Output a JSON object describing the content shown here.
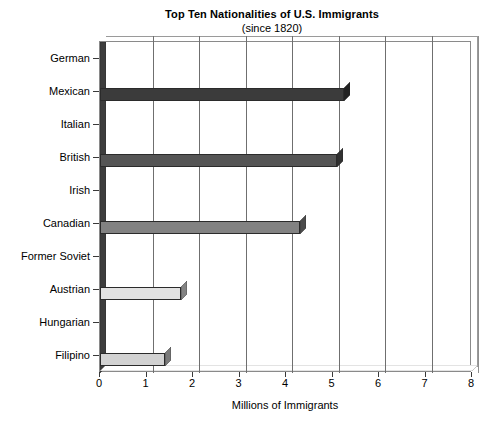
{
  "chart_data": {
    "type": "bar",
    "orientation": "horizontal",
    "title": "Top Ten Nationalities of U.S. Immigrants",
    "subtitle": "(since 1820)",
    "xlabel": "Millions of Immigrants",
    "ylabel": "",
    "xlim": [
      0,
      8
    ],
    "ylim": null,
    "grid": true,
    "legend": false,
    "legend_position": "none",
    "style": "3d-horizontal-bars",
    "xticks": [
      "0",
      "1",
      "2",
      "3",
      "4",
      "5",
      "6",
      "7",
      "8"
    ],
    "xtick_values": [
      0,
      1,
      2,
      3,
      4,
      5,
      6,
      7,
      8
    ],
    "categories": [
      "German",
      "Mexican",
      "Italian",
      "British",
      "Irish",
      "Canadian",
      "Former Soviet",
      "Austrian",
      "Hungarian",
      "Filipino"
    ],
    "values": [
      0,
      5.25,
      0,
      5.1,
      0,
      4.3,
      0,
      1.75,
      0,
      1.4
    ],
    "value_units": "millions",
    "bars": [
      {
        "category": "German",
        "value": 0,
        "color": "#ffffff"
      },
      {
        "category": "Mexican",
        "value": 5.25,
        "color": "#3b3b3b"
      },
      {
        "category": "Italian",
        "value": 0,
        "color": "#ffffff"
      },
      {
        "category": "British",
        "value": 5.1,
        "color": "#555555"
      },
      {
        "category": "Irish",
        "value": 0,
        "color": "#ffffff"
      },
      {
        "category": "Canadian",
        "value": 4.3,
        "color": "#828282"
      },
      {
        "category": "Former Soviet",
        "value": 0,
        "color": "#ffffff"
      },
      {
        "category": "Austrian",
        "value": 1.75,
        "color": "#e2e2e2"
      },
      {
        "category": "Hungarian",
        "value": 0,
        "color": "#ffffff"
      },
      {
        "category": "Filipino",
        "value": 1.4,
        "color": "#d2d2d2"
      }
    ],
    "colors": {
      "plot_border": "#8a8a8a",
      "gridline": "#6f6f6f",
      "wall": "#3d3d3d",
      "floor": "#ffffff",
      "text": "#000000"
    }
  }
}
